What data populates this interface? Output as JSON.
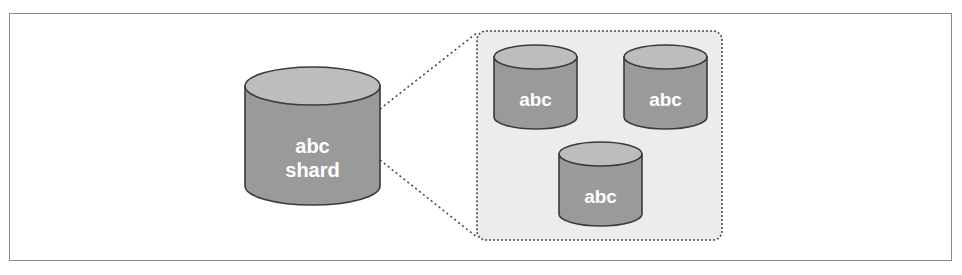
{
  "diagram": {
    "colors": {
      "frame": "#8a8a8a",
      "cylinder_body": "#9a9a9a",
      "cylinder_top": "#bdbdbd",
      "cylinder_stroke": "#3a3a3a",
      "panel_fill": "#ececec",
      "panel_border": "#4a4a4a",
      "label": "#ffffff"
    },
    "shard": {
      "line1": "abc",
      "line2": "shard"
    },
    "replicas": [
      {
        "label": "abc"
      },
      {
        "label": "abc"
      },
      {
        "label": "abc"
      }
    ]
  }
}
